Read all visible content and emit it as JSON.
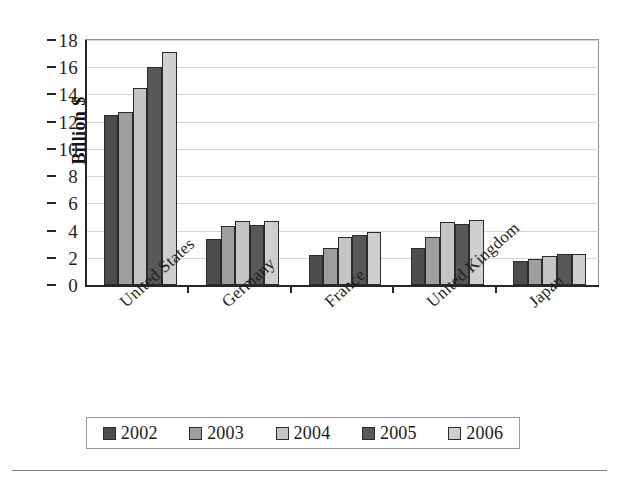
{
  "chart_data": {
    "type": "bar",
    "title": "",
    "subtitle": "",
    "xlabel": "",
    "ylabel": "Billion $",
    "categories": [
      "United States",
      "Germany",
      "France",
      "United Kingdom",
      "Japan"
    ],
    "series": [
      {
        "name": "2002",
        "color": "#4d4d4d",
        "values": [
          12.5,
          3.4,
          2.2,
          2.7,
          1.8
        ]
      },
      {
        "name": "2003",
        "color": "#9e9e9e",
        "values": [
          12.7,
          4.3,
          2.7,
          3.5,
          1.9
        ]
      },
      {
        "name": "2004",
        "color": "#c4c4c4",
        "values": [
          14.5,
          4.7,
          3.5,
          4.6,
          2.1
        ]
      },
      {
        "name": "2005",
        "color": "#585858",
        "values": [
          16.0,
          4.4,
          3.7,
          4.5,
          2.3
        ]
      },
      {
        "name": "2006",
        "color": "#cfcfcf",
        "values": [
          17.1,
          4.7,
          3.9,
          4.8,
          2.3
        ]
      }
    ],
    "ylim": [
      0,
      18
    ],
    "ytick_labels": [
      "18",
      "16",
      "14",
      "12",
      "10",
      "8",
      "6",
      "4",
      "2",
      "0"
    ],
    "ytick_values": [
      18,
      16,
      14,
      12,
      10,
      8,
      6,
      4,
      2,
      0
    ],
    "grid": true,
    "grid_axis": "y",
    "legend_position": "bottom",
    "legend_entries": [
      "2002",
      "2003",
      "2004",
      "2005",
      "2006"
    ],
    "xtick_label_rotation": -42
  }
}
